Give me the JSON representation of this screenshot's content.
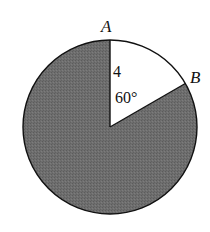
{
  "diagram": {
    "type": "circle-sector",
    "points": {
      "A": "A",
      "B": "B"
    },
    "labels": {
      "radius": "4",
      "angle": "60°"
    },
    "sector_angle_degrees": 60,
    "radius_value": 4,
    "colors": {
      "shaded_region": "#6e6e6e",
      "unshaded_sector": "#ffffff",
      "outline": "#111111"
    }
  }
}
